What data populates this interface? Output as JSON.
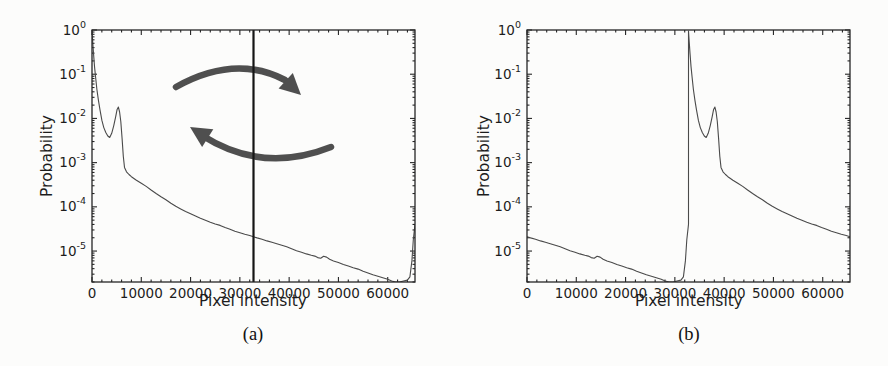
{
  "page": {
    "background": "#fcfcfb"
  },
  "figure": {
    "captions": {
      "a": "(a)",
      "b": "(b)"
    }
  },
  "chart_data": [
    {
      "id": "a",
      "type": "line",
      "title": "",
      "xlabel": "Pixel intensity",
      "ylabel": "Probability",
      "xlim": [
        0,
        65535
      ],
      "yscale": "log",
      "ylim_exponents": [
        -5.7,
        0
      ],
      "xticks": [
        0,
        10000,
        20000,
        30000,
        40000,
        50000,
        60000
      ],
      "ytick_exponents": [
        0,
        -1,
        -2,
        -3,
        -4,
        -5
      ],
      "x_minor_step": 2000,
      "grid": false,
      "legend": "none",
      "line_color": "#4a4a4a",
      "frame_color": "#262626",
      "vline": {
        "x": 32768,
        "color": "#151515",
        "width": 2.2
      },
      "annotation": {
        "type": "rotation-arrows",
        "color": "#3d3d3d"
      },
      "series": [
        {
          "name": "intensity-histogram",
          "points": [
            [
              0,
              0.95
            ],
            [
              150,
              0.55
            ],
            [
              300,
              0.3
            ],
            [
              500,
              0.15
            ],
            [
              700,
              0.09
            ],
            [
              1000,
              0.045
            ],
            [
              1300,
              0.026
            ],
            [
              1600,
              0.016
            ],
            [
              2000,
              0.009
            ],
            [
              2400,
              0.0062
            ],
            [
              2800,
              0.0048
            ],
            [
              3200,
              0.004
            ],
            [
              3600,
              0.0037
            ],
            [
              4000,
              0.0046
            ],
            [
              4400,
              0.0068
            ],
            [
              4800,
              0.011
            ],
            [
              5100,
              0.016
            ],
            [
              5350,
              0.018
            ],
            [
              5600,
              0.014
            ],
            [
              5850,
              0.0085
            ],
            [
              6100,
              0.0035
            ],
            [
              6350,
              0.0014
            ],
            [
              6600,
              0.00078
            ],
            [
              7000,
              0.00062
            ],
            [
              7500,
              0.00054
            ],
            [
              8000,
              0.00048
            ],
            [
              9000,
              0.0004
            ],
            [
              10000,
              0.00034
            ],
            [
              11000,
              0.00029
            ],
            [
              12000,
              0.00024
            ],
            [
              13000,
              0.0002
            ],
            [
              14000,
              0.00017
            ],
            [
              15000,
              0.000145
            ],
            [
              16000,
              0.00012
            ],
            [
              17000,
              0.000103
            ],
            [
              18000,
              9e-05
            ],
            [
              19000,
              7.9e-05
            ],
            [
              20000,
              7e-05
            ],
            [
              21000,
              6.2e-05
            ],
            [
              22000,
              5.5e-05
            ],
            [
              23000,
              5e-05
            ],
            [
              24000,
              4.5e-05
            ],
            [
              25000,
              4.1e-05
            ],
            [
              26000,
              3.8e-05
            ],
            [
              27000,
              3.4e-05
            ],
            [
              28000,
              3.1e-05
            ],
            [
              29000,
              2.8e-05
            ],
            [
              30000,
              2.6e-05
            ],
            [
              31000,
              2.4e-05
            ],
            [
              32000,
              2.25e-05
            ],
            [
              32768,
              2.1e-05
            ],
            [
              33500,
              1.98e-05
            ],
            [
              34500,
              1.85e-05
            ],
            [
              35500,
              1.7e-05
            ],
            [
              36500,
              1.58e-05
            ],
            [
              37500,
              1.47e-05
            ],
            [
              38500,
              1.35e-05
            ],
            [
              39500,
              1.25e-05
            ],
            [
              40500,
              1.13e-05
            ],
            [
              41500,
              1.02e-05
            ],
            [
              42500,
              9.4e-06
            ],
            [
              43500,
              8.6e-06
            ],
            [
              44500,
              8e-06
            ],
            [
              45200,
              7.7e-06
            ],
            [
              45800,
              7.1e-06
            ],
            [
              46400,
              6.9e-06
            ],
            [
              47000,
              7.6e-06
            ],
            [
              47600,
              7.3e-06
            ],
            [
              48200,
              6.5e-06
            ],
            [
              49000,
              6e-06
            ],
            [
              50000,
              5.5e-06
            ],
            [
              51000,
              5e-06
            ],
            [
              52000,
              4.6e-06
            ],
            [
              53000,
              4.2e-06
            ],
            [
              54000,
              3.9e-06
            ],
            [
              55000,
              3.5e-06
            ],
            [
              56000,
              3.2e-06
            ],
            [
              57000,
              2.9e-06
            ],
            [
              58000,
              2.7e-06
            ],
            [
              59000,
              2.5e-06
            ],
            [
              60000,
              2.3e-06
            ],
            [
              60800,
              2.1e-06
            ],
            [
              61600,
              2e-06
            ],
            [
              62400,
              2e-06
            ],
            [
              63200,
              2.1e-06
            ],
            [
              64000,
              2.2e-06
            ],
            [
              64500,
              2.6e-06
            ],
            [
              64900,
              6e-06
            ],
            [
              65200,
              1.8e-05
            ],
            [
              65535,
              4e-05
            ]
          ]
        }
      ]
    },
    {
      "id": "b",
      "type": "line",
      "title": "",
      "xlabel": "Pixel intensity",
      "ylabel": "Probability",
      "xlim": [
        0,
        65535
      ],
      "yscale": "log",
      "ylim_exponents": [
        -5.7,
        0
      ],
      "xticks": [
        0,
        10000,
        20000,
        30000,
        40000,
        50000,
        60000
      ],
      "ytick_exponents": [
        0,
        -1,
        -2,
        -3,
        -4,
        -5
      ],
      "x_minor_step": 2000,
      "grid": false,
      "legend": "none",
      "line_color": "#4a4a4a",
      "frame_color": "#262626",
      "vline": null,
      "annotation": null,
      "series": [
        {
          "name": "rotated-intensity-histogram",
          "points": [
            [
              0,
              2.1e-05
            ],
            [
              732,
              1.98e-05
            ],
            [
              1732,
              1.85e-05
            ],
            [
              2732,
              1.7e-05
            ],
            [
              3732,
              1.58e-05
            ],
            [
              4732,
              1.47e-05
            ],
            [
              5732,
              1.35e-05
            ],
            [
              6732,
              1.25e-05
            ],
            [
              7732,
              1.13e-05
            ],
            [
              8732,
              1.02e-05
            ],
            [
              9732,
              9.4e-06
            ],
            [
              10732,
              8.6e-06
            ],
            [
              11732,
              8e-06
            ],
            [
              12432,
              7.7e-06
            ],
            [
              13032,
              7.1e-06
            ],
            [
              13632,
              6.9e-06
            ],
            [
              14232,
              7.6e-06
            ],
            [
              14832,
              7.3e-06
            ],
            [
              15432,
              6.5e-06
            ],
            [
              16232,
              6e-06
            ],
            [
              17232,
              5.5e-06
            ],
            [
              18232,
              5e-06
            ],
            [
              19232,
              4.6e-06
            ],
            [
              20232,
              4.2e-06
            ],
            [
              21232,
              3.9e-06
            ],
            [
              22232,
              3.5e-06
            ],
            [
              23232,
              3.2e-06
            ],
            [
              24232,
              2.9e-06
            ],
            [
              25232,
              2.7e-06
            ],
            [
              26232,
              2.5e-06
            ],
            [
              27232,
              2.3e-06
            ],
            [
              28032,
              2.1e-06
            ],
            [
              28832,
              2e-06
            ],
            [
              29632,
              2e-06
            ],
            [
              30432,
              2.1e-06
            ],
            [
              31232,
              2.2e-06
            ],
            [
              31732,
              2.6e-06
            ],
            [
              32132,
              6e-06
            ],
            [
              32432,
              1.8e-05
            ],
            [
              32767,
              4e-05
            ],
            [
              32768,
              0.95
            ],
            [
              32918,
              0.55
            ],
            [
              33068,
              0.3
            ],
            [
              33268,
              0.15
            ],
            [
              33468,
              0.09
            ],
            [
              33768,
              0.045
            ],
            [
              34068,
              0.026
            ],
            [
              34368,
              0.016
            ],
            [
              34768,
              0.009
            ],
            [
              35168,
              0.0062
            ],
            [
              35568,
              0.0048
            ],
            [
              35968,
              0.004
            ],
            [
              36368,
              0.0037
            ],
            [
              36768,
              0.0046
            ],
            [
              37168,
              0.0068
            ],
            [
              37568,
              0.011
            ],
            [
              37868,
              0.016
            ],
            [
              38118,
              0.018
            ],
            [
              38368,
              0.014
            ],
            [
              38618,
              0.0085
            ],
            [
              38868,
              0.0035
            ],
            [
              39118,
              0.0014
            ],
            [
              39368,
              0.00078
            ],
            [
              39768,
              0.00062
            ],
            [
              40268,
              0.00054
            ],
            [
              40768,
              0.00048
            ],
            [
              41768,
              0.0004
            ],
            [
              42768,
              0.00034
            ],
            [
              43768,
              0.00029
            ],
            [
              44768,
              0.00024
            ],
            [
              45768,
              0.0002
            ],
            [
              46768,
              0.00017
            ],
            [
              47768,
              0.000145
            ],
            [
              48768,
              0.00012
            ],
            [
              49768,
              0.000103
            ],
            [
              50768,
              9e-05
            ],
            [
              51768,
              7.9e-05
            ],
            [
              52768,
              7e-05
            ],
            [
              53768,
              6.2e-05
            ],
            [
              54768,
              5.5e-05
            ],
            [
              55768,
              5e-05
            ],
            [
              56768,
              4.5e-05
            ],
            [
              57768,
              4.1e-05
            ],
            [
              58768,
              3.8e-05
            ],
            [
              59768,
              3.4e-05
            ],
            [
              60768,
              3.1e-05
            ],
            [
              61768,
              2.8e-05
            ],
            [
              62768,
              2.6e-05
            ],
            [
              63768,
              2.4e-05
            ],
            [
              64768,
              2.25e-05
            ],
            [
              65535,
              2.1e-05
            ]
          ]
        }
      ]
    }
  ]
}
